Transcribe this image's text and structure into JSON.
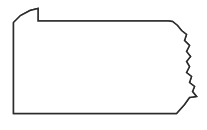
{
  "figure": {
    "kind": "choropleth-map",
    "title": "",
    "caption": "",
    "background_color": "#ffffff"
  },
  "map": {
    "state_name": "Pennsylvania",
    "outline_color": "#2b2b2b",
    "fill_color": "#ffffff",
    "internal_boundary_color": "#d2d2d2",
    "width_px": 207,
    "height_px": 130,
    "state_outline_path": "M 13.5,22.5 L 13.5,113.5 L 176.5,113.5 L 184.5,104.5 L 189.5,97.5 L 196.5,96.5 L 192.5,91.5 L 194.5,86.5 L 189.5,82.5 L 191.5,76.5 L 186.5,72.5 L 189.5,66.5 L 186.5,61.5 L 190.5,56.5 L 186.5,51.5 L 189.5,45.5 L 184.5,40.5 L 186.5,34.5 L 181.5,30.5 L 177.5,25.5 L 172.5,21.5 L 168.5,21.0 L 38.0,21.0 L 38.0,8.5 L 30.0,10.5 L 20.5,15.5 L 13.5,22.5 Z",
    "erie_triangle_note": "northwest notch at top-left of outline"
  },
  "shaded_region": {
    "label": "",
    "color": "#b2b2b2",
    "position": "southeast",
    "path": "M 118.0,66.0 L 124.0,63.5 L 131.0,63.0 L 131.0,60.5 L 140.0,60.0 L 146.0,61.0 L 150.0,59.0 L 158.0,59.5 L 163.0,63.0 L 170.0,63.5 L 176.0,64.5 L 180.0,68.0 L 186.5,72.0 L 189.5,78.0 L 188.5,83.5 L 193.0,87.0 L 191.5,91.5 L 195.0,96.0 L 188.5,97.5 L 183.5,104.5 L 176.0,113.0 L 151.0,113.0 L 147.0,108.0 L 141.0,107.5 L 136.0,102.0 L 130.5,96.5 L 126.0,90.0 L 121.0,85.5 L 116.5,82.0 L 111.5,80.5 L 106.0,77.5 L 111.0,73.0 L 108.0,69.0 L 112.5,67.5 L 115.0,69.5 L 118.0,66.0 Z"
  },
  "internal_boundaries": [
    {
      "name": "west-north-vertical",
      "path": "M 41.0,21.5 L 41.0,38.0 L 36.5,38.0 L 36.5,46.5 L 31.0,46.5 L 31.0,54.0 L 13.5,54.0"
    },
    {
      "name": "west-mid-step",
      "path": "M 41.0,47.0 L 48.0,47.0 L 48.0,54.0 L 41.5,54.0 L 41.5,60.0 L 13.5,60.0"
    },
    {
      "name": "north-central-step",
      "path": "M 41.0,38.0 L 50.0,38.0 L 50.0,43.0 L 58.0,43.0 L 58.0,36.0 L 66.0,36.0 L 66.0,28.0 L 72.5,28.0 L 72.5,21.5"
    },
    {
      "name": "central-vertical",
      "path": "M 72.5,48.0 L 72.5,56.0 L 66.0,56.0 L 66.0,62.0 L 73.0,62.0 L 73.0,69.0 L 69.0,74.0 L 71.0,83.0 L 67.5,92.0 L 70.0,102.0 L 69.0,113.0"
    },
    {
      "name": "central-lower-connector",
      "path": "M 48.0,54.0 L 58.0,54.0 L 58.0,49.0 L 66.0,49.0 L 66.0,56.0"
    },
    {
      "name": "mid-horizontal",
      "path": "M 41.5,60.0 L 66.0,60.0 L 73.0,62.0 L 83.0,62.5 L 93.0,62.0 L 104.0,64.0 L 112.0,66.5 L 118.0,66.0"
    },
    {
      "name": "east-north-vertical",
      "path": "M 124.0,21.5 L 124.0,32.0 L 129.0,37.0 L 129.0,46.0 L 124.5,52.0 L 128.0,58.0 L 131.0,60.5"
    },
    {
      "name": "northeast-vertical",
      "path": "M 152.0,21.5 L 152.0,32.0 L 149.0,40.0 L 152.0,48.0 L 150.0,55.0 L 150.0,59.0"
    },
    {
      "name": "south-central-short",
      "path": "M 104.0,64.0 L 104.0,72.0"
    }
  ],
  "legend": {
    "present": false,
    "entries": []
  },
  "labels": []
}
